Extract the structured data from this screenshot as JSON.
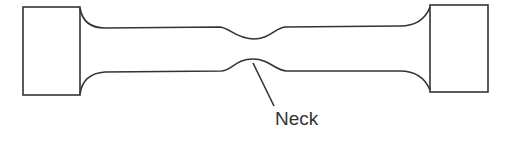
{
  "diagram": {
    "labels": {
      "neck": "Neck"
    },
    "colors": {
      "stroke": "#333333",
      "background": "#ffffff"
    }
  }
}
